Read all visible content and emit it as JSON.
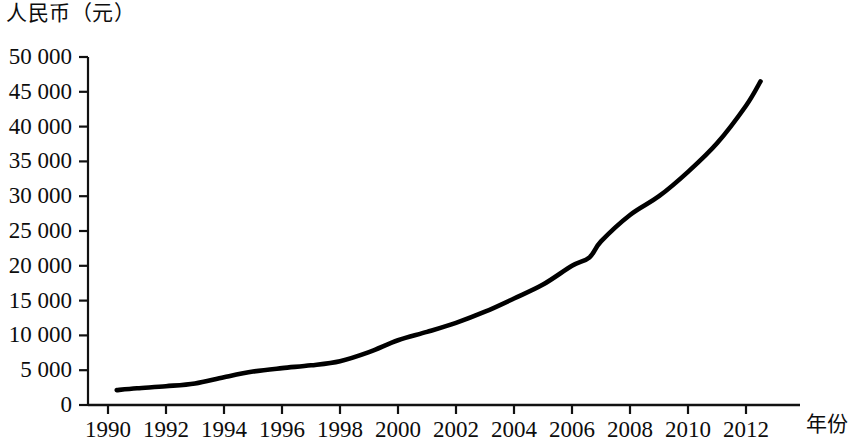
{
  "chart_data": {
    "type": "line",
    "title": "",
    "ylabel": "人民币（元）",
    "xlabel": "年份",
    "xlim": [
      1990,
      2013
    ],
    "ylim": [
      0,
      50000
    ],
    "grid": false,
    "legend": null,
    "line_color": "#000000",
    "axis_color": "#111111",
    "yticks": [
      0,
      5000,
      10000,
      15000,
      20000,
      25000,
      30000,
      35000,
      40000,
      45000,
      50000
    ],
    "ytick_labels": [
      "0",
      "5 000",
      "10 000",
      "15 000",
      "20 000",
      "25 000",
      "30 000",
      "35 000",
      "40 000",
      "45 000",
      "50 000"
    ],
    "xticks": [
      1990,
      1992,
      1994,
      1996,
      1998,
      2000,
      2002,
      2004,
      2006,
      2008,
      2010,
      2012
    ],
    "xtick_labels": [
      "1990",
      "1992",
      "1994",
      "1996",
      "1998",
      "2000",
      "2002",
      "2004",
      "2006",
      "2008",
      "2010",
      "2012"
    ],
    "x": [
      1990.3,
      1991,
      1992,
      1993,
      1994,
      1995,
      1996,
      1997,
      1998,
      1999,
      2000,
      2001,
      2002,
      2003,
      2004,
      2005,
      2006,
      2006.6,
      2007,
      2008,
      2009,
      2010,
      2011,
      2012,
      2012.5
    ],
    "values": [
      2140,
      2400,
      2700,
      3100,
      4000,
      4800,
      5300,
      5700,
      6300,
      7600,
      9300,
      10500,
      11800,
      13400,
      15300,
      17300,
      20000,
      21200,
      23500,
      27300,
      30000,
      33500,
      37600,
      43000,
      46500
    ],
    "series": [
      {
        "name": "人民币（元）",
        "x": [
          1990.3,
          1991,
          1992,
          1993,
          1994,
          1995,
          1996,
          1997,
          1998,
          1999,
          2000,
          2001,
          2002,
          2003,
          2004,
          2005,
          2006,
          2006.6,
          2007,
          2008,
          2009,
          2010,
          2011,
          2012,
          2012.5
        ],
        "values": [
          2140,
          2400,
          2700,
          3100,
          4000,
          4800,
          5300,
          5700,
          6300,
          7600,
          9300,
          10500,
          11800,
          13400,
          15300,
          17300,
          20000,
          21200,
          23500,
          27300,
          30000,
          33500,
          37600,
          43000,
          46500
        ]
      }
    ]
  },
  "geometry": {
    "x_axis_y": 405,
    "y_axis_x": 88,
    "x_axis_right": 800,
    "y_axis_top": 57,
    "px_per_year": 29.0,
    "x_origin_px": 108,
    "y_zero_px": 405,
    "px_per_unit": 0.00696
  }
}
